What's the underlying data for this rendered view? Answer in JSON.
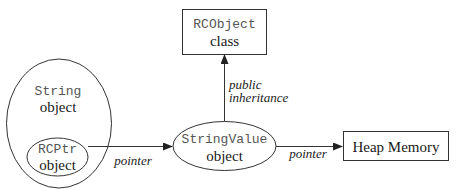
{
  "diagram": {
    "nodes": {
      "rcobject": {
        "line1": "RCObject",
        "line2": "class",
        "shape": "rectangle"
      },
      "string": {
        "line1": "String",
        "line2": "object",
        "shape": "ellipse"
      },
      "rcptr": {
        "line1": "RCPtr",
        "line2": "object",
        "shape": "ellipse"
      },
      "stringvalue": {
        "line1": "StringValue",
        "line2": "object",
        "shape": "ellipse"
      },
      "heap": {
        "line1": "Heap Memory",
        "shape": "rectangle"
      }
    },
    "edges": {
      "rcptr_to_stringvalue": {
        "label": "pointer",
        "from": "RCPtr object",
        "to": "StringValue object"
      },
      "stringvalue_to_rcobject": {
        "label_line1": "public",
        "label_line2": "inheritance",
        "from": "StringValue object",
        "to": "RCObject class"
      },
      "stringvalue_to_heap": {
        "label": "pointer",
        "from": "StringValue object",
        "to": "Heap Memory"
      }
    },
    "colors": {
      "stroke": "#333333",
      "code_text": "#555555",
      "text": "#1a1a1a",
      "background": "#ffffff"
    }
  }
}
